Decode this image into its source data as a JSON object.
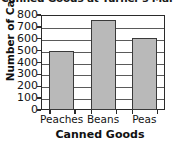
{
  "chart_data": {
    "type": "bar",
    "title": "Canned Goods at Turner's Mar",
    "xlabel": "Canned Goods",
    "ylabel": "Number of Cans",
    "categories": [
      "Peaches",
      "Beans",
      "Peas"
    ],
    "values": [
      500,
      760,
      610
    ],
    "ylim": [
      0,
      800
    ],
    "ytick_labels": [
      "800",
      "700",
      "600",
      "500",
      "400",
      "300",
      "200",
      "100",
      "0"
    ],
    "ytick_values": [
      800,
      700,
      600,
      500,
      400,
      300,
      200,
      100,
      0
    ],
    "ytick_step": 100,
    "grid": true,
    "legend": false,
    "bar_fill_color": "#b9b9b9",
    "bar_edge_color": "#3a3a3a",
    "axis_color": "#2b2b2b"
  }
}
